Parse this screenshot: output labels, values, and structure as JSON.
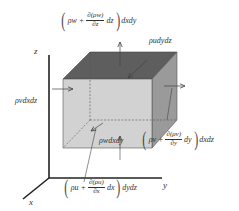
{
  "diagram": {
    "type": "control-volume-mass-flux",
    "colors": {
      "top_face": "#5e5e5e",
      "front_face": "#d2d2d2",
      "right_face": "#9a9a9a",
      "axis": "#222222",
      "arrow": "#444444",
      "text": "#333333"
    },
    "axes": {
      "z": "z",
      "y": "y",
      "x": "x"
    },
    "labels": {
      "top_flux": {
        "open": "(",
        "lead": "ρw +",
        "num": "∂(ρw)",
        "den": "∂z",
        "tail": "dz",
        "close": ")",
        "suffix": "dxdy"
      },
      "right_in_flux": "ρudydz",
      "left_in_flux": "ρvdxdz",
      "bottom_in_flux": "ρwdxdy",
      "right_out_flux": {
        "open": "(",
        "lead": "ρv +",
        "num": "∂(ρv)",
        "den": "∂y",
        "tail": "dy",
        "close": ")",
        "suffix": "dxdz"
      },
      "front_out_flux": {
        "open": "(",
        "lead": "ρu +",
        "num": "∂(ρu)",
        "den": "∂x",
        "tail": "dx",
        "close": ")",
        "suffix": "dydz"
      }
    }
  }
}
